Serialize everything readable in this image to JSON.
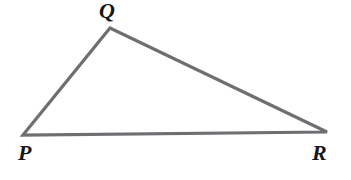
{
  "figure": {
    "name": "triangle-pqr",
    "type": "geometry-diagram",
    "shape": "triangle",
    "background_color": "#ffffff",
    "width": 351,
    "height": 180
  },
  "triangle": {
    "stroke_color": "#6e6e73",
    "stroke_width": 3.2,
    "fill": "none",
    "vertices": [
      {
        "label": "P",
        "x": 23,
        "y": 135
      },
      {
        "label": "Q",
        "x": 110,
        "y": 28
      },
      {
        "label": "R",
        "x": 327,
        "y": 132
      }
    ],
    "sides": [
      {
        "name": "PQ",
        "from": "P",
        "to": "Q"
      },
      {
        "name": "QR",
        "from": "Q",
        "to": "R"
      },
      {
        "name": "RP",
        "from": "R",
        "to": "P"
      }
    ]
  },
  "labels": {
    "q": "Q",
    "p": "P",
    "r": "R"
  }
}
